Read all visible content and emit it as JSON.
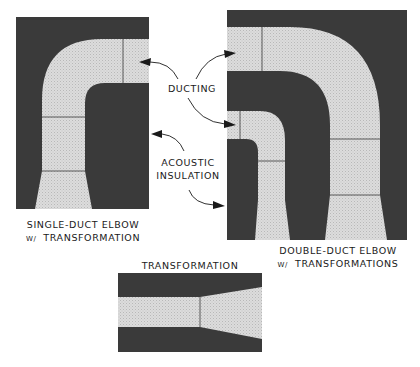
{
  "colors": {
    "insulation": "#3a3a3a",
    "ducting": "#d8d8d8",
    "background": "#ffffff",
    "ink": "#1a1a1a"
  },
  "callouts": {
    "ducting": "DUCTING",
    "acoustic_line1": "ACOUSTIC",
    "acoustic_line2": "INSULATION"
  },
  "captions": {
    "single_duct": {
      "line1": "SINGLE-DUCT ELBOW",
      "line2_prefix": "W/",
      "line2": "TRANSFORMATION"
    },
    "double_duct": {
      "line1": "DOUBLE-DUCT ELBOW",
      "line2_prefix": "W/",
      "line2": "TRANSFORMATIONS"
    },
    "transformation": {
      "title": "TRANSFORMATION"
    }
  },
  "figures": [
    {
      "id": "single-duct-elbow",
      "ducts": 1
    },
    {
      "id": "double-duct-elbow",
      "ducts": 2
    },
    {
      "id": "transformation",
      "ducts": 1
    }
  ]
}
